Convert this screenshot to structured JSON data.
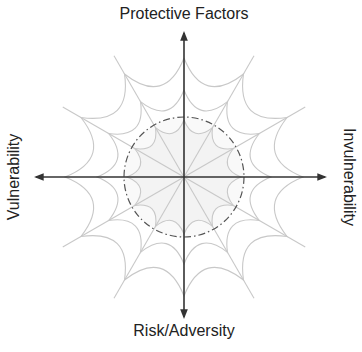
{
  "diagram": {
    "axes": {
      "top": "Protective Factors",
      "bottom": "Risk/Adversity",
      "left": "Vulnerability",
      "right": "Invulnerability"
    },
    "web": {
      "spoke_count": 12,
      "ring_count": 3,
      "inner_region": "dash-dot circle with shaded core"
    },
    "colors": {
      "axis": "#333333",
      "web": "#c8c8c8",
      "core_fill": "#f3f3f3",
      "dash_circle": "#555555",
      "text": "#222222"
    }
  }
}
